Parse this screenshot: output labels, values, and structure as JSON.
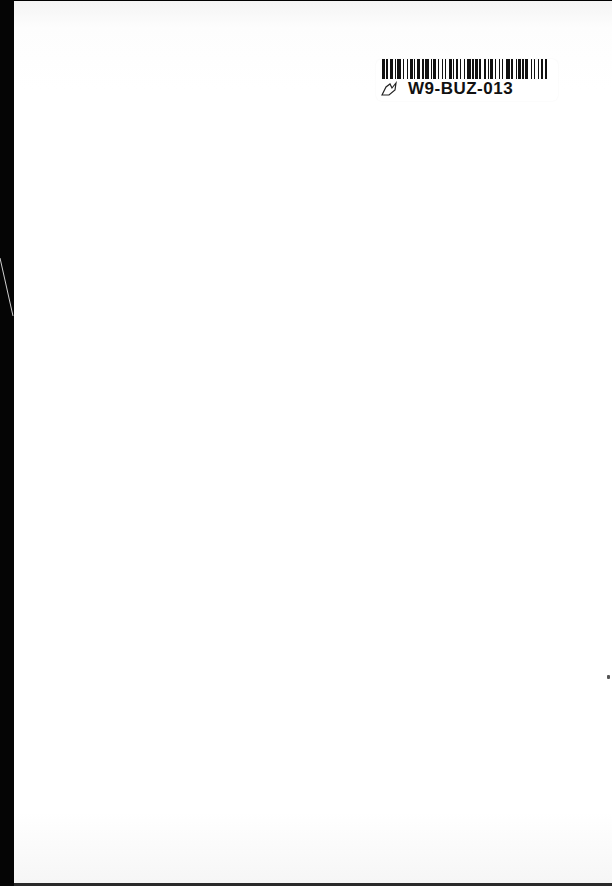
{
  "document": {
    "type": "scanned blank book page",
    "label": {
      "barcode_pattern": [
        2,
        1,
        1,
        2,
        2,
        1,
        1,
        1,
        3,
        1,
        1,
        2,
        1,
        1,
        2,
        1,
        1,
        1,
        2,
        2,
        1,
        1,
        3,
        1,
        1,
        1,
        2,
        1,
        1,
        2,
        1,
        1,
        1,
        2,
        2,
        1,
        1,
        1,
        2,
        1,
        1,
        2,
        1,
        1,
        3,
        1,
        1,
        1,
        2,
        1,
        1,
        2,
        2,
        1,
        1,
        1,
        2,
        1,
        1,
        2,
        1,
        1,
        1,
        2,
        3,
        1,
        1,
        2,
        1,
        1,
        2,
        1,
        1,
        1,
        2,
        2,
        1,
        1,
        1,
        2,
        1,
        1,
        2,
        1,
        2
      ],
      "code": "W9-BUZ-013",
      "mark_icon": "handwritten-check-mark"
    },
    "colors": {
      "page": "#ffffff",
      "spine": "#050505",
      "ink": "#111111"
    }
  }
}
